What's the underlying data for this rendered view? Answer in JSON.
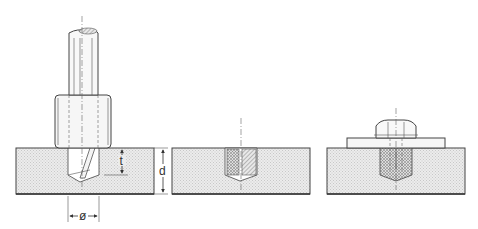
{
  "figure": {
    "steps": [
      {
        "id": "step-1",
        "name": "drilling"
      },
      {
        "id": "step-2",
        "name": "insert-installed"
      },
      {
        "id": "step-3",
        "name": "bolt-fastened"
      }
    ],
    "labels": {
      "depth_t": "t",
      "thickness_d": "d",
      "diameter": "ø"
    },
    "colors": {
      "material_fill": "#e6e6e6",
      "outline": "#444444",
      "background": "#ffffff"
    }
  }
}
